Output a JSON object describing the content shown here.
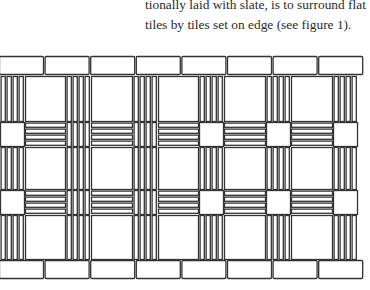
{
  "text": {
    "lines": [
      "tionally laid with slate, is to surround flat",
      "tiles by tiles set on edge (see figure 1)."
    ]
  },
  "figure": {
    "label": "figure 1",
    "stroke_color": "#333333",
    "fill_color": "#ffffff",
    "top_flat_tiles": 8,
    "bottom_flat_tiles": 8,
    "columns_x": [
      0,
      66,
      133,
      199,
      266,
      333
    ],
    "column_width": 24,
    "bands": [
      {
        "type": "vertical",
        "y": 76,
        "h": 45
      },
      {
        "type": "horizontal",
        "y": 122,
        "h": 24,
        "crossings": [
          "square",
          "vbars",
          "vbars",
          "square",
          "square",
          "square"
        ]
      },
      {
        "type": "vertical",
        "y": 147,
        "h": 42
      },
      {
        "type": "horizontal",
        "y": 190,
        "h": 24,
        "crossings": [
          "square",
          "vbars",
          "vbars",
          "square",
          "square",
          "square"
        ]
      },
      {
        "type": "vertical",
        "y": 215,
        "h": 44
      }
    ]
  }
}
